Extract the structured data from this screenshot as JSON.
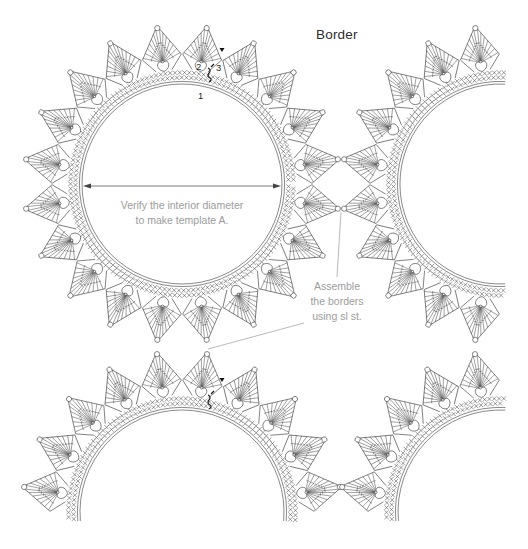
{
  "title": "Border",
  "labels": {
    "row_1": "1",
    "row_2": "2",
    "row_3": "3"
  },
  "annotations": {
    "interior": {
      "line1": "Verify the interior diameter",
      "line2": "to make template A."
    },
    "assemble": {
      "line1": "Assemble",
      "line2": "the borders",
      "line3": "using sl st."
    }
  },
  "diagram": {
    "type": "crochet-chart",
    "colors": {
      "line": "#3a3a3a",
      "marker": "#111111",
      "arrow": "#444444",
      "leader": "#8a8a8a",
      "annotation_text": "#9c9c9c",
      "title": "#2d2d2d"
    },
    "spikes": {
      "count": 20,
      "step": 18,
      "offset": 9,
      "length": 60
    },
    "rings": [
      {
        "name": "ring-center",
        "cx": 182,
        "cy": 184,
        "r": 100,
        "start": 0,
        "end": 360
      },
      {
        "name": "ring-right-partial",
        "cx": 500,
        "cy": 184,
        "r": 100,
        "start": 87,
        "end": 273
      },
      {
        "name": "ring-bottom-left-partial",
        "cx": 182,
        "cy": 512,
        "r": 102,
        "start": 175,
        "end": 365
      },
      {
        "name": "ring-bottom-right-partial",
        "cx": 500,
        "cy": 512,
        "r": 102,
        "start": 175,
        "end": 273
      }
    ],
    "start_markers": [
      {
        "x": 222,
        "y": 50,
        "sx": 208,
        "sy": 74
      },
      {
        "x": 222,
        "y": 380,
        "sx": 208,
        "sy": 401
      }
    ]
  }
}
